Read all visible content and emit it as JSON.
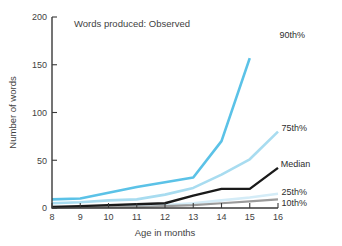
{
  "chart_data": {
    "type": "line",
    "title": "Words produced: Observed",
    "xlabel": "Age in months",
    "ylabel": "Number of words",
    "x": [
      8,
      9,
      10,
      11,
      12,
      13,
      14,
      15,
      16
    ],
    "xlim": [
      8,
      16
    ],
    "ylim": [
      0,
      200
    ],
    "xticks": [
      "8",
      "9",
      "10",
      "11",
      "12",
      "13",
      "14",
      "15",
      "16"
    ],
    "yticks": [
      "0",
      "50",
      "100",
      "150",
      "200"
    ],
    "grid": false,
    "legend_position": "right-inline-labels",
    "series": [
      {
        "name": "90th%",
        "label": "90th%",
        "color": "#5bc2e7",
        "width": 2.6,
        "x": [
          8,
          9,
          10,
          11,
          12,
          13,
          14,
          15
        ],
        "values": [
          9,
          10,
          16,
          22,
          27,
          32,
          70,
          157
        ]
      },
      {
        "name": "75th%",
        "label": "75th%",
        "color": "#a8dcf0",
        "width": 2.6,
        "x": [
          8,
          9,
          10,
          11,
          12,
          13,
          14,
          15,
          16
        ],
        "values": [
          5,
          6,
          8,
          9,
          14,
          21,
          35,
          51,
          80
        ]
      },
      {
        "name": "Median",
        "label": "Median",
        "color": "#1a1a1a",
        "width": 2.4,
        "x": [
          8,
          9,
          10,
          11,
          12,
          13,
          14,
          15,
          16
        ],
        "values": [
          1,
          2,
          3,
          4,
          5,
          13,
          20,
          20,
          42
        ]
      },
      {
        "name": "25th%",
        "label": "25th%",
        "color": "#d4ecf7",
        "width": 2.6,
        "x": [
          8,
          9,
          10,
          11,
          12,
          13,
          14,
          15,
          16
        ],
        "values": [
          1,
          1,
          2,
          2,
          3,
          5,
          8,
          11,
          15
        ]
      },
      {
        "name": "10th%",
        "label": "10th%",
        "color": "#9b9b9b",
        "width": 2.2,
        "x": [
          8,
          9,
          10,
          11,
          12,
          13,
          14,
          15,
          16
        ],
        "values": [
          0,
          1,
          1,
          1,
          2,
          3,
          5,
          7,
          9
        ]
      }
    ],
    "annotations": [
      {
        "text": "90th%",
        "x": 16.05,
        "y": 181
      },
      {
        "text": "75th%",
        "x": 16.12,
        "y": 84
      },
      {
        "text": "Median",
        "x": 16.1,
        "y": 46
      },
      {
        "text": "25th%",
        "x": 16.12,
        "y": 17
      },
      {
        "text": "10th%",
        "x": 16.12,
        "y": 6
      }
    ]
  }
}
